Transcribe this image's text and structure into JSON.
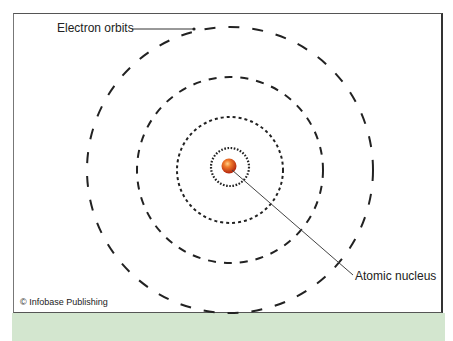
{
  "diagram": {
    "labels": {
      "electron_orbits": "Electron orbits",
      "atomic_nucleus": "Atomic nucleus"
    },
    "credit": "© Infobase Publishing",
    "colors": {
      "nucleus": "#d9431c",
      "orbit": "#222222",
      "band": "#d3e6cf"
    },
    "orbits": [
      {
        "name": "inner",
        "radius": 53
      },
      {
        "name": "middle",
        "radius": 93
      },
      {
        "name": "outer",
        "radius": 143
      }
    ]
  }
}
